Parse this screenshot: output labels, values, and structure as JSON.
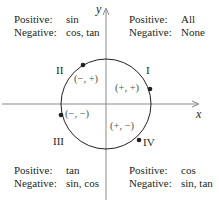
{
  "axes": {
    "x_label": "x",
    "y_label": "y"
  },
  "quadrants": [
    {
      "numeral": "I",
      "sign": "(+, +)",
      "positive_key": "Positive:",
      "positive": "All",
      "negative_key": "Negative:",
      "negative": "None"
    },
    {
      "numeral": "II",
      "sign": "(−, +)",
      "positive_key": "Positive:",
      "positive": "sin",
      "negative_key": "Negative:",
      "negative": "cos, tan"
    },
    {
      "numeral": "III",
      "sign": "(−, −)",
      "positive_key": "Positive:",
      "positive": "tan",
      "negative_key": "Negative:",
      "negative": "sin, cos"
    },
    {
      "numeral": "IV",
      "sign": "(+, −)",
      "positive_key": "Positive:",
      "positive": "cos",
      "negative_key": "Negative:",
      "negative": "sin, tan"
    }
  ],
  "colors": {
    "line": "#231f20",
    "sign_text": "#555555"
  }
}
